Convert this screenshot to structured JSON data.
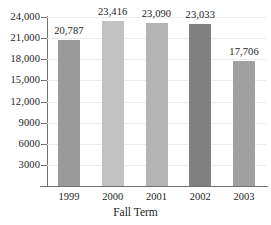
{
  "chart_data": {
    "type": "bar",
    "title": "",
    "xlabel": "Fall Term",
    "ylabel": "",
    "categories": [
      "1999",
      "2000",
      "2001",
      "2002",
      "2003"
    ],
    "values": [
      20787,
      23416,
      23090,
      23033,
      17706
    ],
    "value_labels": [
      "20,787",
      "23,416",
      "23,090",
      "23,033",
      "17,706"
    ],
    "bar_colors": [
      "#9a9a9a",
      "#c2c2c2",
      "#b4b4b4",
      "#808080",
      "#a0a0a0"
    ],
    "ylim": [
      0,
      24000
    ],
    "ytick_values": [
      24000,
      21000,
      18000,
      15000,
      12000,
      9000,
      6000,
      3000
    ],
    "ytick_labels": [
      "24,000",
      "21,000",
      "18,000",
      "15,000",
      "12,000",
      "9000",
      "6000",
      "3000"
    ],
    "grid": true,
    "grid_color": "#ececec",
    "axis_color": "#6f6f6f",
    "legend": "none",
    "background": "#ffffff"
  }
}
